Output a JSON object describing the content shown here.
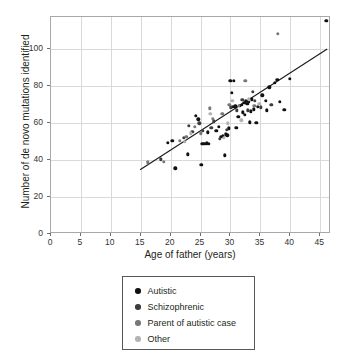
{
  "figure": {
    "background_color": "#ffffff",
    "frame_color": "#a8a8a8",
    "grid_color": "#d9d9d9"
  },
  "chart_data": {
    "type": "scatter",
    "title": "",
    "xlabel": "Age of father (years)",
    "ylabel": "Number of de novo mutations identified",
    "xlim": [
      0,
      46.8
    ],
    "ylim": [
      0,
      117.5
    ],
    "xticks": [
      0,
      5,
      10,
      15,
      20,
      25,
      30,
      35,
      40,
      45
    ],
    "yticks": [
      0,
      20,
      40,
      60,
      80,
      100
    ],
    "xticklabels": [
      "0",
      "5",
      "10",
      "15",
      "20",
      "25",
      "30",
      "35",
      "40",
      "45"
    ],
    "yticklabels": [
      "0",
      "20",
      "40",
      "60",
      "80",
      "100"
    ],
    "grid": true,
    "grid_axis": "both",
    "legend_position": "below-plot",
    "trendline": {
      "type": "linear-fit",
      "color": "#1a1a1a",
      "x_start": 15.0,
      "y_start": 34.0,
      "x_end": 46.5,
      "y_end": 100.0,
      "slope": 2.1,
      "intercept": 2.5
    },
    "series": [
      {
        "name": "Autistic",
        "color": "#111111",
        "points": [
          [
            19.5,
            49.5
          ],
          [
            20.3,
            50.5
          ],
          [
            20.8,
            35.5
          ],
          [
            22.9,
            43.2
          ],
          [
            24.2,
            64.0
          ],
          [
            24.6,
            62.0
          ],
          [
            25.1,
            37.5
          ],
          [
            25.3,
            49.0
          ],
          [
            25.6,
            48.8
          ],
          [
            26.0,
            49.2
          ],
          [
            26.4,
            49.0
          ],
          [
            26.2,
            55.0
          ],
          [
            27.6,
            56.0
          ],
          [
            28.0,
            58.2
          ],
          [
            28.4,
            52.5
          ],
          [
            28.7,
            53.0
          ],
          [
            29.0,
            42.6
          ],
          [
            29.2,
            54.0
          ],
          [
            29.5,
            53.5
          ],
          [
            29.7,
            57.2
          ],
          [
            30.0,
            83.0
          ],
          [
            30.6,
            83.0
          ],
          [
            30.2,
            76.5
          ],
          [
            30.4,
            69.0
          ],
          [
            30.8,
            69.2
          ],
          [
            31.0,
            57.5
          ],
          [
            31.3,
            63.5
          ],
          [
            31.6,
            69.5
          ],
          [
            31.9,
            70.0
          ],
          [
            32.1,
            66.0
          ],
          [
            32.3,
            71.0
          ],
          [
            32.4,
            64.5
          ],
          [
            32.6,
            72.0
          ],
          [
            32.8,
            70.5
          ],
          [
            33.0,
            71.5
          ],
          [
            33.2,
            60.5
          ],
          [
            33.4,
            66.5
          ],
          [
            33.6,
            73.0
          ],
          [
            33.9,
            67.5
          ],
          [
            34.3,
            60.2
          ],
          [
            34.6,
            69.0
          ],
          [
            35.3,
            75.0
          ],
          [
            35.9,
            72.0
          ],
          [
            36.1,
            67.0
          ],
          [
            36.5,
            79.5
          ],
          [
            37.4,
            82.0
          ],
          [
            37.8,
            83.5
          ],
          [
            38.2,
            71.5
          ],
          [
            39.0,
            67.2
          ],
          [
            39.9,
            84.0
          ],
          [
            46.0,
            115.5
          ]
        ]
      },
      {
        "name": "Schizophrenic",
        "color": "#3d3d3d",
        "points": [
          [
            18.4,
            40.5
          ],
          [
            22.2,
            52.0
          ],
          [
            23.0,
            58.5
          ],
          [
            23.6,
            55.5
          ],
          [
            24.8,
            60.0
          ],
          [
            25.4,
            56.0
          ],
          [
            26.8,
            57.5
          ],
          [
            27.2,
            61.0
          ],
          [
            28.2,
            51.5
          ],
          [
            29.4,
            56.5
          ],
          [
            30.1,
            68.5
          ],
          [
            31.1,
            67.0
          ],
          [
            32.0,
            72.5
          ],
          [
            32.9,
            67.0
          ],
          [
            33.7,
            77.0
          ],
          [
            34.1,
            72.0
          ],
          [
            35.1,
            68.5
          ],
          [
            36.8,
            70.0
          ]
        ]
      },
      {
        "name": "Parent of autistic case",
        "color": "#777777",
        "points": [
          [
            16.2,
            38.8
          ],
          [
            18.9,
            39.0
          ],
          [
            21.5,
            50.5
          ],
          [
            22.6,
            52.5
          ],
          [
            24.0,
            58.0
          ],
          [
            25.0,
            54.5
          ],
          [
            26.5,
            68.0
          ],
          [
            27.0,
            62.5
          ],
          [
            28.6,
            65.0
          ],
          [
            29.8,
            70.0
          ],
          [
            31.4,
            69.5
          ],
          [
            32.5,
            83.0
          ],
          [
            34.0,
            69.5
          ],
          [
            37.9,
            108.5
          ]
        ]
      },
      {
        "name": "Other",
        "color": "#b3b3b3",
        "points": [
          [
            22.4,
            50.0
          ],
          [
            23.4,
            54.5
          ],
          [
            26.6,
            65.0
          ],
          [
            28.9,
            52.0
          ],
          [
            29.6,
            60.0
          ],
          [
            30.3,
            72.0
          ],
          [
            31.8,
            61.5
          ],
          [
            33.1,
            73.0
          ],
          [
            34.8,
            70.5
          ]
        ]
      }
    ]
  },
  "legend": {
    "border_color": "#58585a",
    "items": [
      {
        "label": "Autistic",
        "color": "#111111"
      },
      {
        "label": "Schizophrenic",
        "color": "#3d3d3d"
      },
      {
        "label": "Parent of autistic case",
        "color": "#777777"
      },
      {
        "label": "Other",
        "color": "#b3b3b3"
      }
    ]
  }
}
